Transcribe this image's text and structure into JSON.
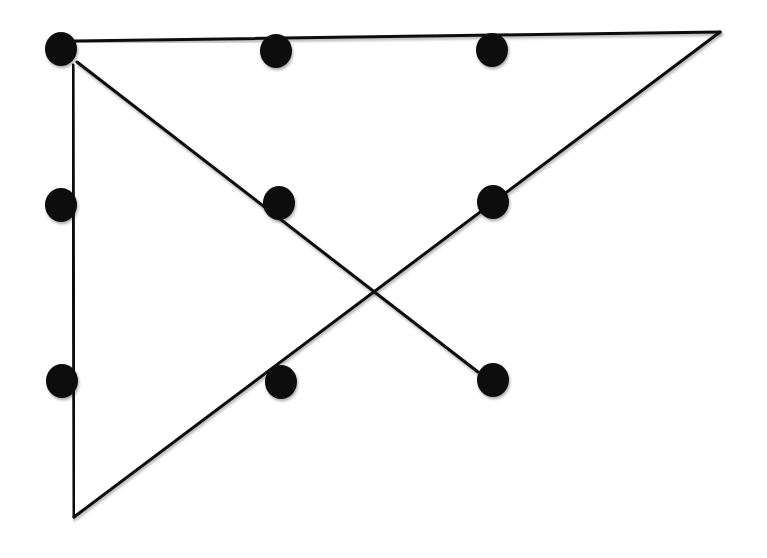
{
  "diagram": {
    "colors": {
      "dot": "#111111",
      "line": "#111111",
      "background": "#ffffff"
    },
    "dot_radius": 16,
    "dots": [
      {
        "id": "r1c1",
        "x": 61,
        "y": 49
      },
      {
        "id": "r1c2",
        "x": 276,
        "y": 51
      },
      {
        "id": "r1c3",
        "x": 492,
        "y": 50
      },
      {
        "id": "r2c1",
        "x": 61,
        "y": 205
      },
      {
        "id": "r2c2",
        "x": 279,
        "y": 203
      },
      {
        "id": "r2c3",
        "x": 493,
        "y": 202
      },
      {
        "id": "r3c1",
        "x": 62,
        "y": 381
      },
      {
        "id": "r3c2",
        "x": 281,
        "y": 382
      },
      {
        "id": "r3c3",
        "x": 493,
        "y": 380
      }
    ],
    "lines": [
      {
        "id": "top-line",
        "x1": 75,
        "y1": 41,
        "x2": 720,
        "y2": 32
      },
      {
        "id": "right-diagonal",
        "x1": 720,
        "y1": 32,
        "x2": 74,
        "y2": 517
      },
      {
        "id": "left-vertical",
        "x1": 73,
        "y1": 65,
        "x2": 74,
        "y2": 517
      },
      {
        "id": "cross-diagonal",
        "x1": 77,
        "y1": 62,
        "x2": 478,
        "y2": 372
      }
    ]
  }
}
